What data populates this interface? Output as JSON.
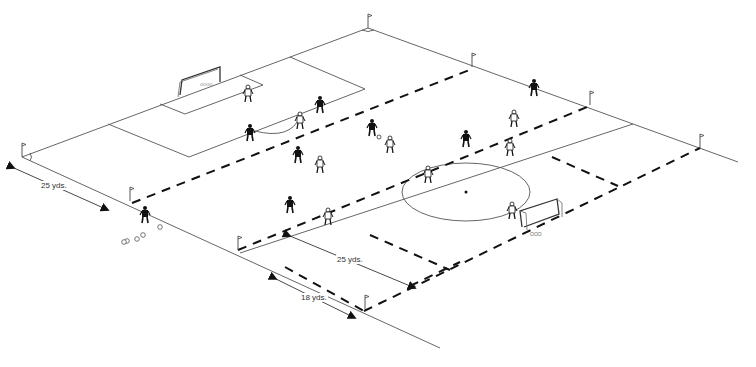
{
  "diagram": {
    "title": "",
    "type": "soccer field drill setup (isometric)",
    "colors": {
      "field_lines": "#555555",
      "grid_dashes": "#111111",
      "players": "#111111",
      "background": "#ffffff"
    },
    "dimensions": [
      {
        "id": "dim-left",
        "label": "25 yds."
      },
      {
        "id": "dim-mid",
        "label": "25 yds."
      },
      {
        "id": "dim-bottom",
        "label": "18 yds."
      }
    ],
    "elements": {
      "goals": [
        "goal-far-left",
        "goal-near-right"
      ],
      "center_circle": true,
      "corner_flags": 2,
      "cone_flags": 6,
      "balls_count": 5
    }
  }
}
